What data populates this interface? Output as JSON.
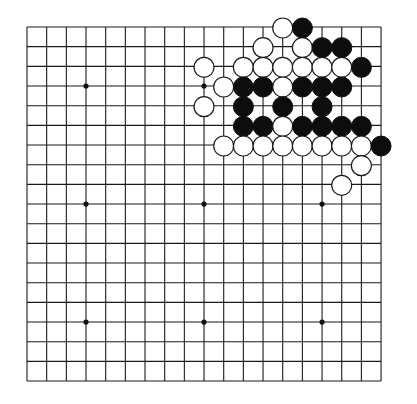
{
  "board": {
    "size": 19,
    "origin_x": 27,
    "origin_y": 27,
    "spacing": 19.67,
    "stone_radius": 10,
    "colors": {
      "background": "#ffffff",
      "line": "#1a1a1a",
      "black_stone": "#0d0d0d",
      "white_stone": "#ffffff"
    },
    "star_points": [
      [
        3,
        3
      ],
      [
        9,
        3
      ],
      [
        15,
        3
      ],
      [
        3,
        9
      ],
      [
        9,
        9
      ],
      [
        15,
        9
      ],
      [
        3,
        15
      ],
      [
        9,
        15
      ],
      [
        15,
        15
      ]
    ],
    "stones": [
      {
        "color": "white",
        "col": 13,
        "row": 0
      },
      {
        "color": "black",
        "col": 14,
        "row": 0
      },
      {
        "color": "white",
        "col": 12,
        "row": 1
      },
      {
        "color": "white",
        "col": 14,
        "row": 1
      },
      {
        "color": "black",
        "col": 15,
        "row": 1
      },
      {
        "color": "black",
        "col": 16,
        "row": 1
      },
      {
        "color": "white",
        "col": 9,
        "row": 2
      },
      {
        "color": "white",
        "col": 11,
        "row": 2
      },
      {
        "color": "white",
        "col": 12,
        "row": 2
      },
      {
        "color": "white",
        "col": 13,
        "row": 2
      },
      {
        "color": "white",
        "col": 14,
        "row": 2
      },
      {
        "color": "white",
        "col": 15,
        "row": 2
      },
      {
        "color": "white",
        "col": 16,
        "row": 2
      },
      {
        "color": "black",
        "col": 17,
        "row": 2
      },
      {
        "color": "white",
        "col": 10,
        "row": 3
      },
      {
        "color": "black",
        "col": 11,
        "row": 3
      },
      {
        "color": "black",
        "col": 12,
        "row": 3
      },
      {
        "color": "white",
        "col": 13,
        "row": 3
      },
      {
        "color": "black",
        "col": 14,
        "row": 3
      },
      {
        "color": "black",
        "col": 15,
        "row": 3
      },
      {
        "color": "black",
        "col": 16,
        "row": 3
      },
      {
        "color": "white",
        "col": 9,
        "row": 4
      },
      {
        "color": "black",
        "col": 11,
        "row": 4
      },
      {
        "color": "black",
        "col": 13,
        "row": 4
      },
      {
        "color": "black",
        "col": 15,
        "row": 4
      },
      {
        "color": "black",
        "col": 11,
        "row": 5
      },
      {
        "color": "black",
        "col": 12,
        "row": 5
      },
      {
        "color": "white",
        "col": 13,
        "row": 5
      },
      {
        "color": "black",
        "col": 14,
        "row": 5
      },
      {
        "color": "black",
        "col": 15,
        "row": 5
      },
      {
        "color": "black",
        "col": 16,
        "row": 5
      },
      {
        "color": "black",
        "col": 17,
        "row": 5
      },
      {
        "color": "white",
        "col": 10,
        "row": 6
      },
      {
        "color": "white",
        "col": 11,
        "row": 6
      },
      {
        "color": "white",
        "col": 12,
        "row": 6
      },
      {
        "color": "white",
        "col": 13,
        "row": 6
      },
      {
        "color": "white",
        "col": 14,
        "row": 6
      },
      {
        "color": "white",
        "col": 15,
        "row": 6
      },
      {
        "color": "white",
        "col": 16,
        "row": 6
      },
      {
        "color": "white",
        "col": 17,
        "row": 6
      },
      {
        "color": "black",
        "col": 18,
        "row": 6
      },
      {
        "color": "white",
        "col": 17,
        "row": 7
      },
      {
        "color": "white",
        "col": 16,
        "row": 8
      }
    ]
  }
}
